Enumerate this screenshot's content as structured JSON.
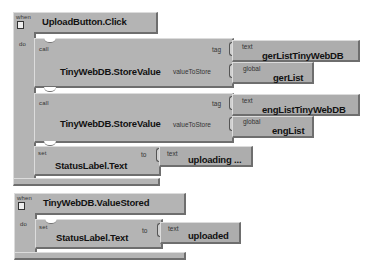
{
  "event1": {
    "when_label": "when",
    "do_label": "do",
    "name": "UploadButton.Click",
    "statements": [
      {
        "kind_label": "call",
        "name": "TinyWebDB.StoreValue",
        "tag_label": "tag",
        "value_label": "valueToStore",
        "tag_block": {
          "kind_label": "text",
          "value": "gerListTinyWebDB"
        },
        "value_block": {
          "kind_label": "global",
          "value": "gerList"
        }
      },
      {
        "kind_label": "call",
        "name": "TinyWebDB.StoreValue",
        "tag_label": "tag",
        "value_label": "valueToStore",
        "tag_block": {
          "kind_label": "text",
          "value": "engListTinyWebDB"
        },
        "value_block": {
          "kind_label": "global",
          "value": "engList"
        }
      },
      {
        "kind_label": "set",
        "name": "StatusLabel.Text",
        "to_label": "to",
        "value_block": {
          "kind_label": "text",
          "value": "uploading ..."
        }
      }
    ]
  },
  "event2": {
    "when_label": "when",
    "do_label": "do",
    "name": "TinyWebDB.ValueStored",
    "statements": [
      {
        "kind_label": "set",
        "name": "StatusLabel.Text",
        "to_label": "to",
        "value_block": {
          "kind_label": "text",
          "value": "uploaded"
        }
      }
    ]
  },
  "colors": {
    "block": "#b4b4b4",
    "shadow": "#6e6e6e",
    "highlight": "#dcdcdc",
    "background": "#ffffff"
  }
}
